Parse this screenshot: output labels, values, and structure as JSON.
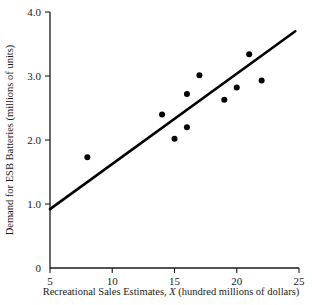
{
  "chart_data": {
    "type": "scatter",
    "title": "",
    "xlabel": "Recreational Sales Estimates, X (hundred millions of dollars)",
    "xlabel_prefix": "Recreational Sales Estimates, ",
    "xlabel_var": "X",
    "xlabel_suffix": " (hundred millions of dollars)",
    "ylabel": "Demand for ESB Batteries (millions of units)",
    "xlim": [
      5,
      25
    ],
    "ylim": [
      0,
      4.0
    ],
    "grid": false,
    "legend": false,
    "xticks": [
      5,
      10,
      15,
      20,
      25
    ],
    "xtick_labels": [
      "5",
      "10",
      "15",
      "20",
      "25"
    ],
    "yticks": [
      0,
      1.0,
      2.0,
      3.0,
      4.0
    ],
    "ytick_labels": [
      "0",
      "1.0",
      "2.0",
      "3.0",
      "4.0"
    ],
    "x": [
      8,
      14,
      15,
      16,
      16,
      17,
      19,
      20,
      21,
      22
    ],
    "y": [
      1.73,
      2.4,
      2.02,
      2.72,
      2.2,
      3.01,
      2.63,
      2.82,
      3.34,
      2.93
    ],
    "points": [
      {
        "x": 8,
        "y": 1.73
      },
      {
        "x": 14,
        "y": 2.4
      },
      {
        "x": 15,
        "y": 2.02
      },
      {
        "x": 16,
        "y": 2.72
      },
      {
        "x": 16,
        "y": 2.2
      },
      {
        "x": 17,
        "y": 3.01
      },
      {
        "x": 19,
        "y": 2.63
      },
      {
        "x": 20,
        "y": 2.82
      },
      {
        "x": 21,
        "y": 3.34
      },
      {
        "x": 22,
        "y": 2.93
      }
    ],
    "fit_line": {
      "name": "regression line",
      "x_start": 5,
      "y_start": 0.92,
      "x_end": 24.7,
      "y_end": 3.7
    },
    "marker_color": "#000000",
    "line_color": "#000000",
    "axis_color": "#1a1a1a",
    "background_color": "#ffffff"
  }
}
